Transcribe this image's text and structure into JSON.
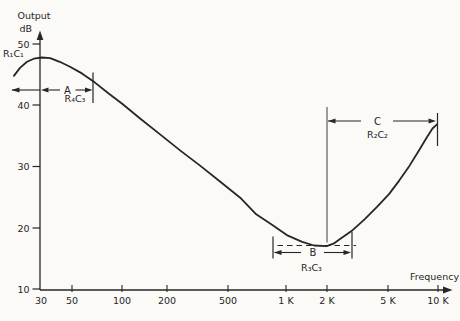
{
  "figure": {
    "y_axis_title_line1": "Output",
    "y_axis_title_line2": "dB",
    "x_axis_title": "Frequency",
    "y_ticks": [
      "50",
      "40",
      "30",
      "20",
      "10"
    ],
    "x_ticks": [
      "30",
      "50",
      "100",
      "200",
      "500",
      "1 K",
      "2 K",
      "5 K",
      "10 K"
    ]
  },
  "annotations": {
    "r1c1": "R₁C₁",
    "a": "A",
    "r4c3": "R₄C₃",
    "b": "B",
    "r3c3": "R₃C₃",
    "c": "C",
    "r2c2": "R₂C₂"
  },
  "colors": {
    "ink": "#262626",
    "paper": "#fbfaf7"
  },
  "chart_data": {
    "type": "line",
    "title": "",
    "xlabel": "Frequency",
    "ylabel": "Output dB",
    "x_scale": "log",
    "xlim_hz": [
      20,
      10000
    ],
    "ylim_db": [
      10,
      50
    ],
    "x_tick_values_hz": [
      30,
      50,
      100,
      200,
      500,
      1000,
      2000,
      5000,
      10000
    ],
    "y_tick_values_db": [
      50,
      40,
      30,
      20,
      10
    ],
    "grid": false,
    "curve_points": [
      [
        20.5,
        44.8
      ],
      [
        22.4,
        46.1
      ],
      [
        24.8,
        47.1
      ],
      [
        27.4,
        47.6
      ],
      [
        30.9,
        47.8
      ],
      [
        34.8,
        47.7
      ],
      [
        40,
        47.1
      ],
      [
        46.5,
        46.3
      ],
      [
        55.3,
        45.2
      ],
      [
        67,
        43.7
      ],
      [
        81,
        42.0
      ],
      [
        100,
        40.2
      ],
      [
        130,
        37.8
      ],
      [
        174,
        35.2
      ],
      [
        233,
        32.6
      ],
      [
        312,
        30.1
      ],
      [
        417,
        27.5
      ],
      [
        558,
        24.9
      ],
      [
        705,
        22.2
      ],
      [
        888,
        20.5
      ],
      [
        1120,
        18.7
      ],
      [
        1380,
        17.7
      ],
      [
        1640,
        17.1
      ],
      [
        1970,
        17.0
      ],
      [
        2180,
        17.4
      ],
      [
        2410,
        18.2
      ],
      [
        2880,
        19.6
      ],
      [
        3440,
        21.4
      ],
      [
        4110,
        23.4
      ],
      [
        4900,
        25.5
      ],
      [
        5690,
        27.7
      ],
      [
        6600,
        30.1
      ],
      [
        7540,
        32.5
      ],
      [
        8480,
        34.7
      ],
      [
        9250,
        36.2
      ],
      [
        9920,
        36.9
      ]
    ],
    "breakpoint_regions": [
      {
        "label": "R₁C₁",
        "note": "low-frequency corner near 30 Hz, extends left of axis"
      },
      {
        "label": "A",
        "time_constant": "R₄C₃",
        "approx_range_hz": [
          30,
          65
        ]
      },
      {
        "label": "B",
        "time_constant": "R₃C₃",
        "approx_range_hz": [
          900,
          2900
        ]
      },
      {
        "label": "C",
        "time_constant": "R₂C₂",
        "approx_range_hz": [
          2000,
          10000
        ]
      }
    ]
  }
}
